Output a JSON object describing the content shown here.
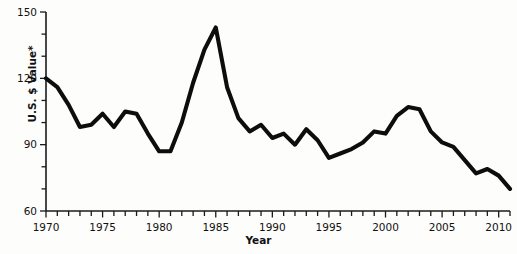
{
  "chart_data": {
    "type": "line",
    "title": "",
    "xlabel": "Year",
    "ylabel": "U.S. $ Value*",
    "xlim": [
      1970,
      2011
    ],
    "ylim": [
      60,
      150
    ],
    "yticks": [
      60,
      90,
      120,
      150
    ],
    "ytick_labels": [
      "60",
      "90",
      "120",
      "150"
    ],
    "yminor_step": 10,
    "xticks": [
      1970,
      1975,
      1980,
      1985,
      1990,
      1995,
      2000,
      2005,
      2010
    ],
    "xtick_labels": [
      "1970",
      "1975",
      "1980",
      "1985",
      "1990",
      "1995",
      "2000",
      "2005",
      "2010"
    ],
    "xminor_step": 1,
    "grid": false,
    "legend": false,
    "series": [
      {
        "name": "U.S. $ Value*",
        "color": "#0d0d0d",
        "x": [
          1970,
          1971,
          1972,
          1973,
          1974,
          1975,
          1976,
          1977,
          1978,
          1979,
          1980,
          1981,
          1982,
          1983,
          1984,
          1985,
          1986,
          1987,
          1988,
          1989,
          1990,
          1991,
          1992,
          1993,
          1994,
          1995,
          1996,
          1997,
          1998,
          1999,
          2000,
          2001,
          2002,
          2003,
          2004,
          2005,
          2006,
          2007,
          2008,
          2009,
          2010,
          2011
        ],
        "values": [
          120,
          116,
          108,
          98,
          99,
          104,
          98,
          105,
          104,
          95,
          87,
          87,
          100,
          118,
          133,
          143,
          116,
          102,
          96,
          99,
          93,
          95,
          90,
          97,
          92,
          84,
          86,
          88,
          91,
          96,
          95,
          103,
          107,
          106,
          96,
          91,
          89,
          83,
          77,
          79,
          76,
          70
        ]
      }
    ]
  },
  "axis": {
    "y_title": "U.S. $ Value*",
    "x_title": "Year"
  }
}
